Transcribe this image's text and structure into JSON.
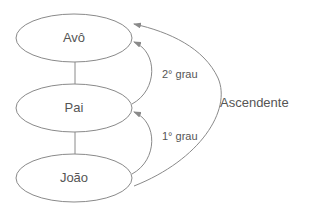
{
  "diagram": {
    "type": "kinship-ascendant-degrees",
    "nodes": [
      {
        "id": "avo",
        "label": "Avô"
      },
      {
        "id": "pai",
        "label": "Pai"
      },
      {
        "id": "joao",
        "label": "João"
      }
    ],
    "edges": [
      {
        "from": "joao",
        "to": "pai",
        "label": "1° grau"
      },
      {
        "from": "pai",
        "to": "avo",
        "label": "2° grau"
      },
      {
        "from": "joao",
        "to": "avo",
        "label": "Ascendente"
      }
    ],
    "colors": {
      "stroke": "#8a8a8a",
      "text": "#555555",
      "background": "#ffffff"
    }
  }
}
